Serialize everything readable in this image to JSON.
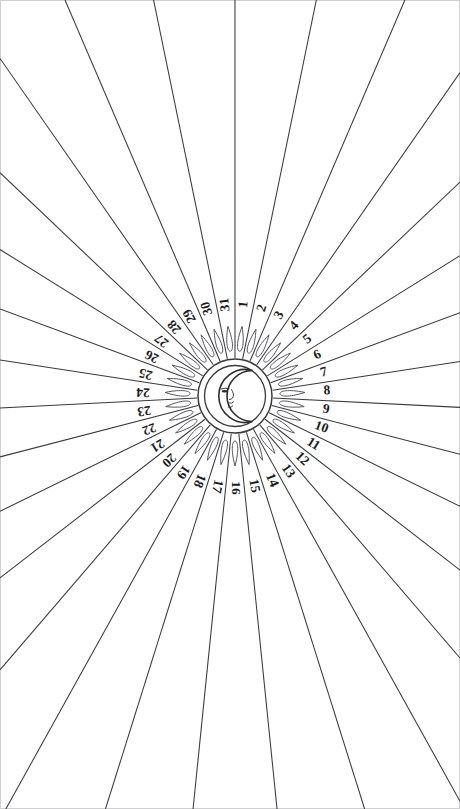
{
  "figure": {
    "kind": "radial-dial",
    "background_color": "#ffffff",
    "line_color": "#3a3a3c",
    "number_color": "#1c1c1e",
    "petal_stroke_color": "#55555a",
    "border_color": "#cfcfd2"
  },
  "canvas": {
    "width": 460,
    "height": 809
  },
  "center": {
    "cx": 235,
    "cy": 396
  },
  "geometry": {
    "disc_outer_radius": 37,
    "disc_inner_radius": 31,
    "petal_inner_radius": 45,
    "petal_outer_radius": 70,
    "number_radius": 92,
    "ray_start_radius": 38,
    "sector_count": 31,
    "first_sector_offset_degrees": 5.8,
    "degrees_per_sector": 11.6129
  },
  "center_emblem": {
    "name": "crescent-moon-with-face",
    "description": "Crescent moon in profile with eye, nose and lips, enclosed in a double circle"
  },
  "numbers": [
    "1",
    "2",
    "3",
    "4",
    "5",
    "6",
    "7",
    "8",
    "9",
    "10",
    "11",
    "12",
    "13",
    "14",
    "15",
    "16",
    "17",
    "18",
    "19",
    "20",
    "21",
    "22",
    "23",
    "24",
    "25",
    "26",
    "27",
    "28",
    "29",
    "30",
    "31"
  ],
  "chart_data": {
    "type": "pie",
    "categories": [
      "1",
      "2",
      "3",
      "4",
      "5",
      "6",
      "7",
      "8",
      "9",
      "10",
      "11",
      "12",
      "13",
      "14",
      "15",
      "16",
      "17",
      "18",
      "19",
      "20",
      "21",
      "22",
      "23",
      "24",
      "25",
      "26",
      "27",
      "28",
      "29",
      "30",
      "31"
    ],
    "values": [
      1,
      1,
      1,
      1,
      1,
      1,
      1,
      1,
      1,
      1,
      1,
      1,
      1,
      1,
      1,
      1,
      1,
      1,
      1,
      1,
      1,
      1,
      1,
      1,
      1,
      1,
      1,
      1,
      1,
      1,
      1
    ],
    "xlabel": "",
    "ylabel": "",
    "legend": "none",
    "grid": false,
    "annotations": [
      "Center emblem: crescent moon with a face",
      "31 equal radial sectors, each labelled with a day number",
      "Numbers read outward along each radius; lower half appears inverted",
      "Each sector carries a teardrop-shaped flame ornament near the hub",
      "Divider rays continue past the number ring to the page edges"
    ]
  }
}
